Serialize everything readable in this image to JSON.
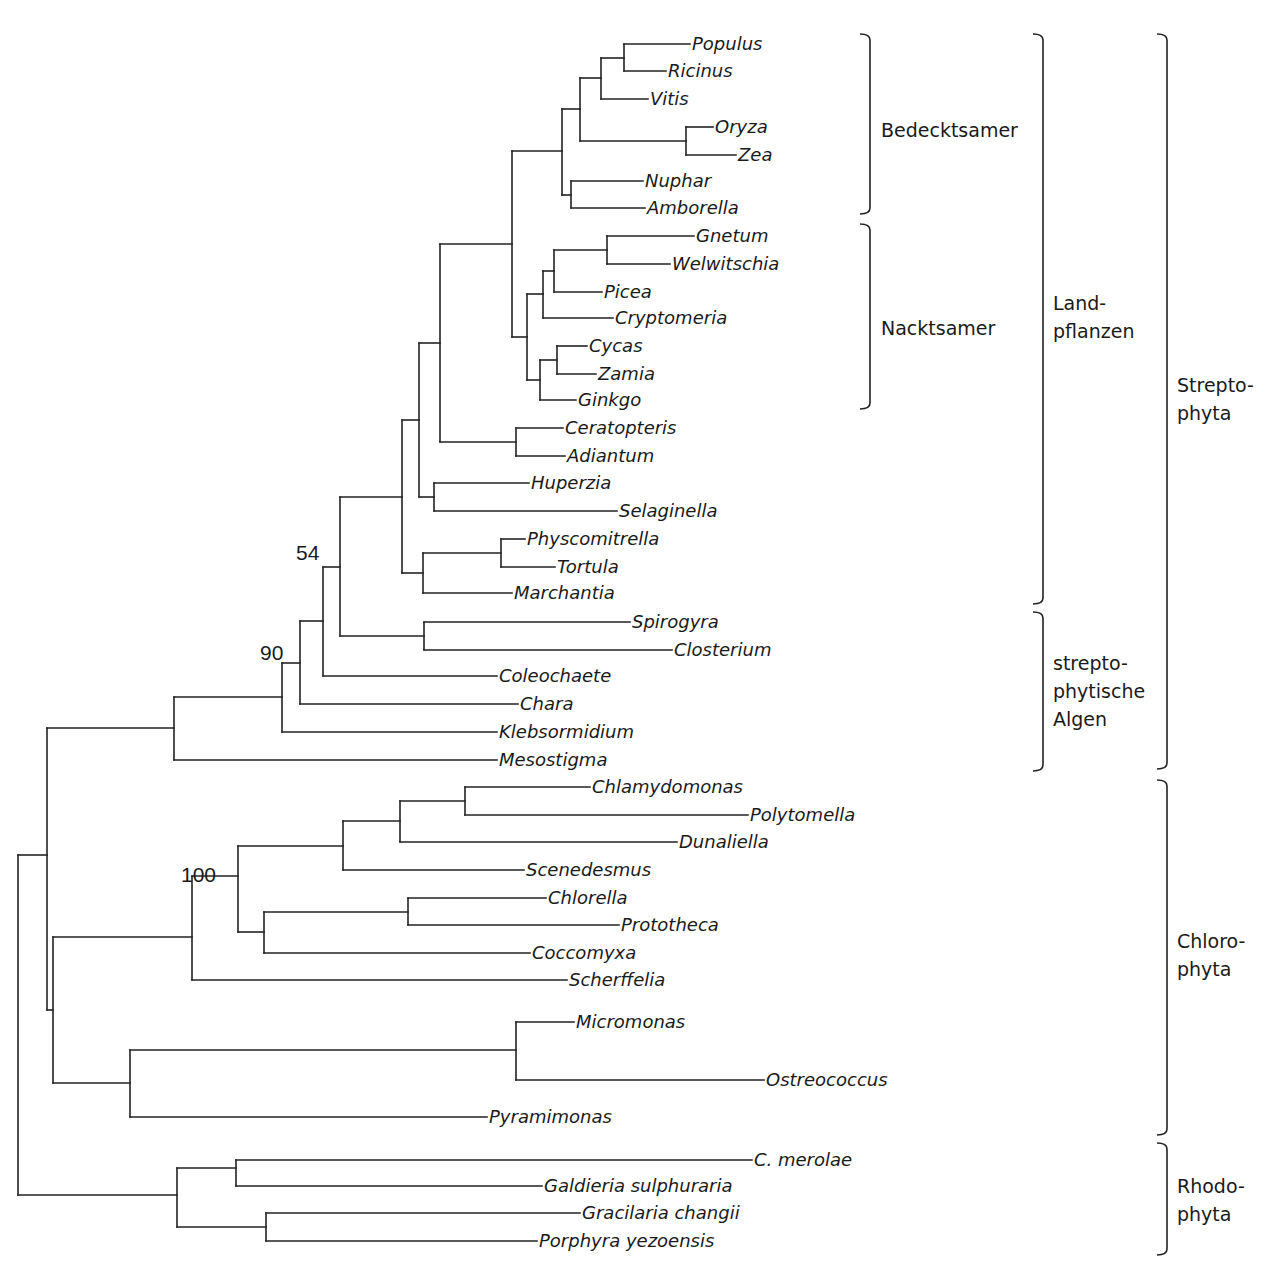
{
  "diagram": {
    "type": "phylogenetic-tree",
    "taxa": [
      {
        "name": "Populus",
        "y": 44,
        "x_end": 690
      },
      {
        "name": "Ricinus",
        "y": 71,
        "x_end": 666
      },
      {
        "name": "Vitis",
        "y": 99,
        "x_end": 648
      },
      {
        "name": "Oryza",
        "y": 127,
        "x_end": 713
      },
      {
        "name": "Zea",
        "y": 155,
        "x_end": 736
      },
      {
        "name": "Nuphar",
        "y": 181,
        "x_end": 643
      },
      {
        "name": "Amborella",
        "y": 208,
        "x_end": 645
      },
      {
        "name": "Gnetum",
        "y": 236,
        "x_end": 694
      },
      {
        "name": "Welwitschia",
        "y": 264,
        "x_end": 670
      },
      {
        "name": "Picea",
        "y": 292,
        "x_end": 602
      },
      {
        "name": "Cryptomeria",
        "y": 318,
        "x_end": 613
      },
      {
        "name": "Cycas",
        "y": 346,
        "x_end": 587
      },
      {
        "name": "Zamia",
        "y": 374,
        "x_end": 596
      },
      {
        "name": "Ginkgo",
        "y": 400,
        "x_end": 576
      },
      {
        "name": "Ceratopteris",
        "y": 428,
        "x_end": 563
      },
      {
        "name": "Adiantum",
        "y": 456,
        "x_end": 565
      },
      {
        "name": "Huperzia",
        "y": 483,
        "x_end": 529
      },
      {
        "name": "Selaginella",
        "y": 511,
        "x_end": 617
      },
      {
        "name": "Physcomitrella",
        "y": 539,
        "x_end": 525
      },
      {
        "name": "Tortula",
        "y": 567,
        "x_end": 555
      },
      {
        "name": "Marchantia",
        "y": 593,
        "x_end": 512
      },
      {
        "name": "Spirogyra",
        "y": 622,
        "x_end": 630
      },
      {
        "name": "Closterium",
        "y": 650,
        "x_end": 672
      },
      {
        "name": "Coleochaete",
        "y": 676,
        "x_end": 497
      },
      {
        "name": "Chara",
        "y": 704,
        "x_end": 518
      },
      {
        "name": "Klebsormidium",
        "y": 732,
        "x_end": 497
      },
      {
        "name": "Mesostigma",
        "y": 760,
        "x_end": 497
      },
      {
        "name": "Chlamydomonas",
        "y": 787,
        "x_end": 590
      },
      {
        "name": "Polytomella",
        "y": 815,
        "x_end": 748
      },
      {
        "name": "Dunaliella",
        "y": 842,
        "x_end": 677
      },
      {
        "name": "Scenedesmus",
        "y": 870,
        "x_end": 524
      },
      {
        "name": "Chlorella",
        "y": 898,
        "x_end": 546
      },
      {
        "name": "Prototheca",
        "y": 925,
        "x_end": 619
      },
      {
        "name": "Coccomyxa",
        "y": 953,
        "x_end": 530
      },
      {
        "name": "Scherffelia",
        "y": 980,
        "x_end": 567
      },
      {
        "name": "Micromonas",
        "y": 1022,
        "x_end": 574
      },
      {
        "name": "Ostreococcus",
        "y": 1080,
        "x_end": 764
      },
      {
        "name": "Pyramimonas",
        "y": 1117,
        "x_end": 487
      },
      {
        "name": "C. merolae",
        "y": 1160,
        "x_end": 752
      },
      {
        "name": "Galdieria sulphuraria",
        "y": 1186,
        "x_end": 542
      },
      {
        "name": "Gracilaria changii",
        "y": 1213,
        "x_end": 580
      },
      {
        "name": "Porphyra yezoensis",
        "y": 1241,
        "x_end": 537
      }
    ],
    "support_values": [
      {
        "value": "54",
        "x": 296,
        "y": 560
      },
      {
        "value": "90",
        "x": 260,
        "y": 660
      },
      {
        "value": "100",
        "x": 181,
        "y": 882
      }
    ],
    "groups_inner": [
      {
        "label_lines": [
          "Bedecktsamer"
        ],
        "y_top": 34,
        "y_bottom": 214,
        "x": 870,
        "text_x": 881,
        "text_y": 137
      },
      {
        "label_lines": [
          "Nacktsamer"
        ],
        "y_top": 224,
        "y_bottom": 409,
        "x": 870,
        "text_x": 881,
        "text_y": 335
      }
    ],
    "groups_middle": [
      {
        "label_lines": [
          "Land-",
          "pflanzen"
        ],
        "y_top": 34,
        "y_bottom": 604,
        "x": 1043,
        "text_x": 1053,
        "text_y": 310
      },
      {
        "label_lines": [
          "strepto-",
          "phytische",
          "Algen"
        ],
        "y_top": 612,
        "y_bottom": 771,
        "x": 1043,
        "text_x": 1053,
        "text_y": 670
      }
    ],
    "groups_outer": [
      {
        "label_lines": [
          "Strepto-",
          "phyta"
        ],
        "y_top": 34,
        "y_bottom": 769,
        "x": 1167,
        "text_x": 1177,
        "text_y": 392
      },
      {
        "label_lines": [
          "Chloro-",
          "phyta"
        ],
        "y_top": 780,
        "y_bottom": 1135,
        "x": 1167,
        "text_x": 1177,
        "text_y": 948
      },
      {
        "label_lines": [
          "Rhodo-",
          "phyta"
        ],
        "y_top": 1143,
        "y_bottom": 1255,
        "x": 1167,
        "text_x": 1177,
        "text_y": 1193
      }
    ],
    "nodes": [
      {
        "x": 624,
        "y1": 44,
        "y2": 71
      },
      {
        "x": 601,
        "y1": 58,
        "y2": 99
      },
      {
        "x": 686,
        "y1": 127,
        "y2": 155
      },
      {
        "x": 580,
        "y1": 78,
        "y2": 141
      },
      {
        "x": 571,
        "y1": 181,
        "y2": 208
      },
      {
        "x": 562,
        "y1": 109,
        "y2": 195
      },
      {
        "x": 607,
        "y1": 236,
        "y2": 264
      },
      {
        "x": 554,
        "y1": 250,
        "y2": 292
      },
      {
        "x": 543,
        "y1": 271,
        "y2": 318
      },
      {
        "x": 557,
        "y1": 346,
        "y2": 374
      },
      {
        "x": 540,
        "y1": 360,
        "y2": 400
      },
      {
        "x": 527,
        "y1": 294,
        "y2": 380
      },
      {
        "x": 512,
        "y1": 151,
        "y2": 337
      },
      {
        "x": 516,
        "y1": 428,
        "y2": 456
      },
      {
        "x": 440,
        "y1": 244,
        "y2": 442
      },
      {
        "x": 434,
        "y1": 483,
        "y2": 511
      },
      {
        "x": 419,
        "y1": 343,
        "y2": 497
      },
      {
        "x": 501,
        "y1": 539,
        "y2": 567
      },
      {
        "x": 423,
        "y1": 553,
        "y2": 593
      },
      {
        "x": 402,
        "y1": 420,
        "y2": 573
      },
      {
        "x": 424,
        "y1": 622,
        "y2": 650
      },
      {
        "x": 340,
        "y1": 497,
        "y2": 636
      },
      {
        "x": 323,
        "y1": 567,
        "y2": 676
      },
      {
        "x": 300,
        "y1": 621,
        "y2": 704
      },
      {
        "x": 282,
        "y1": 663,
        "y2": 732
      },
      {
        "x": 174,
        "y1": 697,
        "y2": 760
      },
      {
        "x": 465,
        "y1": 787,
        "y2": 815
      },
      {
        "x": 400,
        "y1": 801,
        "y2": 842
      },
      {
        "x": 343,
        "y1": 821,
        "y2": 870
      },
      {
        "x": 408,
        "y1": 898,
        "y2": 925
      },
      {
        "x": 264,
        "y1": 912,
        "y2": 953
      },
      {
        "x": 238,
        "y1": 846,
        "y2": 932
      },
      {
        "x": 192,
        "y1": 876,
        "y2": 980
      },
      {
        "x": 516,
        "y1": 1022,
        "y2": 1080
      },
      {
        "x": 130,
        "y1": 1050,
        "y2": 1117
      },
      {
        "x": 53,
        "y1": 937,
        "y2": 1083
      },
      {
        "x": 47,
        "y1": 728,
        "y2": 1010
      },
      {
        "x": 236,
        "y1": 1160,
        "y2": 1186
      },
      {
        "x": 266,
        "y1": 1213,
        "y2": 1241
      },
      {
        "x": 177,
        "y1": 1168,
        "y2": 1227
      },
      {
        "x": 18,
        "y1": 855,
        "y2": 1195
      }
    ],
    "edges": [
      {
        "x1": 624,
        "x2": 690,
        "y": 44
      },
      {
        "x1": 624,
        "x2": 666,
        "y": 71
      },
      {
        "x1": 601,
        "x2": 624,
        "y": 58
      },
      {
        "x1": 601,
        "x2": 648,
        "y": 99
      },
      {
        "x1": 686,
        "x2": 713,
        "y": 127
      },
      {
        "x1": 686,
        "x2": 736,
        "y": 155
      },
      {
        "x1": 580,
        "x2": 601,
        "y": 78
      },
      {
        "x1": 580,
        "x2": 686,
        "y": 141
      },
      {
        "x1": 571,
        "x2": 643,
        "y": 181
      },
      {
        "x1": 571,
        "x2": 645,
        "y": 208
      },
      {
        "x1": 562,
        "x2": 580,
        "y": 109
      },
      {
        "x1": 562,
        "x2": 571,
        "y": 195
      },
      {
        "x1": 607,
        "x2": 694,
        "y": 236
      },
      {
        "x1": 607,
        "x2": 670,
        "y": 264
      },
      {
        "x1": 554,
        "x2": 607,
        "y": 250
      },
      {
        "x1": 554,
        "x2": 602,
        "y": 292
      },
      {
        "x1": 543,
        "x2": 554,
        "y": 271
      },
      {
        "x1": 543,
        "x2": 613,
        "y": 318
      },
      {
        "x1": 557,
        "x2": 587,
        "y": 346
      },
      {
        "x1": 557,
        "x2": 596,
        "y": 374
      },
      {
        "x1": 540,
        "x2": 557,
        "y": 360
      },
      {
        "x1": 540,
        "x2": 576,
        "y": 400
      },
      {
        "x1": 527,
        "x2": 543,
        "y": 294
      },
      {
        "x1": 527,
        "x2": 540,
        "y": 380
      },
      {
        "x1": 512,
        "x2": 562,
        "y": 151
      },
      {
        "x1": 512,
        "x2": 527,
        "y": 337
      },
      {
        "x1": 516,
        "x2": 563,
        "y": 428
      },
      {
        "x1": 516,
        "x2": 565,
        "y": 456
      },
      {
        "x1": 440,
        "x2": 512,
        "y": 244
      },
      {
        "x1": 440,
        "x2": 516,
        "y": 442
      },
      {
        "x1": 434,
        "x2": 529,
        "y": 483
      },
      {
        "x1": 434,
        "x2": 617,
        "y": 511
      },
      {
        "x1": 419,
        "x2": 440,
        "y": 343
      },
      {
        "x1": 419,
        "x2": 434,
        "y": 497
      },
      {
        "x1": 501,
        "x2": 525,
        "y": 539
      },
      {
        "x1": 501,
        "x2": 555,
        "y": 567
      },
      {
        "x1": 423,
        "x2": 501,
        "y": 553
      },
      {
        "x1": 423,
        "x2": 512,
        "y": 593
      },
      {
        "x1": 402,
        "x2": 419,
        "y": 420
      },
      {
        "x1": 402,
        "x2": 423,
        "y": 573
      },
      {
        "x1": 424,
        "x2": 630,
        "y": 622
      },
      {
        "x1": 424,
        "x2": 672,
        "y": 650
      },
      {
        "x1": 340,
        "x2": 402,
        "y": 497
      },
      {
        "x1": 340,
        "x2": 424,
        "y": 636
      },
      {
        "x1": 323,
        "x2": 340,
        "y": 567
      },
      {
        "x1": 323,
        "x2": 497,
        "y": 676
      },
      {
        "x1": 300,
        "x2": 323,
        "y": 621
      },
      {
        "x1": 300,
        "x2": 518,
        "y": 704
      },
      {
        "x1": 282,
        "x2": 300,
        "y": 663
      },
      {
        "x1": 282,
        "x2": 497,
        "y": 732
      },
      {
        "x1": 174,
        "x2": 282,
        "y": 697
      },
      {
        "x1": 174,
        "x2": 497,
        "y": 760
      },
      {
        "x1": 465,
        "x2": 590,
        "y": 787
      },
      {
        "x1": 465,
        "x2": 748,
        "y": 815
      },
      {
        "x1": 400,
        "x2": 465,
        "y": 801
      },
      {
        "x1": 400,
        "x2": 677,
        "y": 842
      },
      {
        "x1": 343,
        "x2": 400,
        "y": 821
      },
      {
        "x1": 343,
        "x2": 524,
        "y": 870
      },
      {
        "x1": 408,
        "x2": 546,
        "y": 898
      },
      {
        "x1": 408,
        "x2": 619,
        "y": 925
      },
      {
        "x1": 264,
        "x2": 408,
        "y": 912
      },
      {
        "x1": 264,
        "x2": 530,
        "y": 953
      },
      {
        "x1": 238,
        "x2": 343,
        "y": 846
      },
      {
        "x1": 238,
        "x2": 264,
        "y": 932
      },
      {
        "x1": 192,
        "x2": 238,
        "y": 876
      },
      {
        "x1": 192,
        "x2": 567,
        "y": 980
      },
      {
        "x1": 516,
        "x2": 574,
        "y": 1022
      },
      {
        "x1": 516,
        "x2": 764,
        "y": 1080
      },
      {
        "x1": 130,
        "x2": 516,
        "y": 1050
      },
      {
        "x1": 130,
        "x2": 487,
        "y": 1117
      },
      {
        "x1": 53,
        "x2": 192,
        "y": 937
      },
      {
        "x1": 53,
        "x2": 130,
        "y": 1083
      },
      {
        "x1": 47,
        "x2": 174,
        "y": 728
      },
      {
        "x1": 47,
        "x2": 53,
        "y": 1010
      },
      {
        "x1": 236,
        "x2": 752,
        "y": 1160
      },
      {
        "x1": 236,
        "x2": 542,
        "y": 1186
      },
      {
        "x1": 266,
        "x2": 580,
        "y": 1213
      },
      {
        "x1": 266,
        "x2": 537,
        "y": 1241
      },
      {
        "x1": 177,
        "x2": 236,
        "y": 1168
      },
      {
        "x1": 177,
        "x2": 266,
        "y": 1227
      },
      {
        "x1": 18,
        "x2": 47,
        "y": 855
      },
      {
        "x1": 18,
        "x2": 177,
        "y": 1195
      }
    ]
  }
}
